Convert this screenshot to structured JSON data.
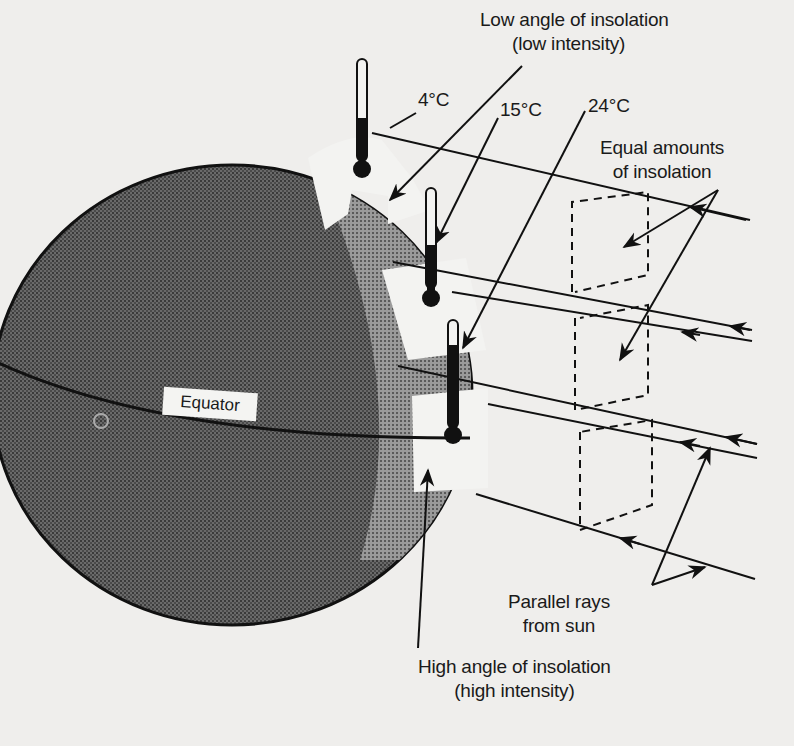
{
  "diagram": {
    "type": "insolation-angle-diagram",
    "colors": {
      "background": "#efeeec",
      "globe_fill": "#5e5e5e",
      "globe_dark": "#3c3c3c",
      "lit_band": "#8a8a8a",
      "patch_fill": "#f3f3f1",
      "ink": "#111111"
    },
    "labels": {
      "low_angle_line1": "Low angle of insolation",
      "low_angle_line2": "(low intensity)",
      "temp_4": "4°C",
      "temp_15": "15°C",
      "temp_24": "24°C",
      "equal_line1": "Equal amounts",
      "equal_line2": "of insolation",
      "equator": "Equator",
      "parallel_line1": "Parallel rays",
      "parallel_line2": "from sun",
      "high_angle_line1": "High angle of insolation",
      "high_angle_line2": "(high intensity)"
    },
    "thermometers": [
      {
        "name": "high-latitude",
        "reading": "4°C"
      },
      {
        "name": "mid-latitude",
        "reading": "15°C"
      },
      {
        "name": "low-latitude",
        "reading": "24°C"
      }
    ]
  }
}
